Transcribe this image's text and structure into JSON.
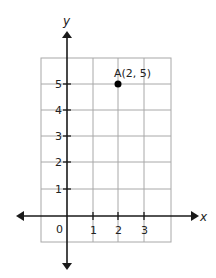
{
  "diagram": {
    "type": "coordinate-plane",
    "axes": {
      "x_label": "x",
      "y_label": "y",
      "origin_label": "0"
    },
    "x_ticks": [
      "1",
      "2",
      "3"
    ],
    "y_ticks": [
      "1",
      "2",
      "3",
      "4",
      "5"
    ],
    "points": [
      {
        "label": "A(2, 5)",
        "x": 2,
        "y": 5
      }
    ],
    "colors": {
      "grid": "#a8a8a8",
      "axis": "#1a1a1a",
      "point": "#000000"
    }
  }
}
